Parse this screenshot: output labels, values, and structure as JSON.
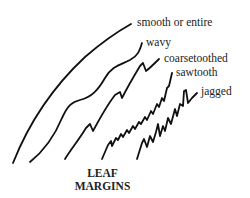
{
  "diagram": {
    "title_line1": "LEAF",
    "title_line2": "MARGINS",
    "margins": [
      {
        "label": "smooth or entire",
        "style": "smooth"
      },
      {
        "label": "wavy",
        "style": "wavy"
      },
      {
        "label": "coarsetoothed",
        "style": "coarse-toothed"
      },
      {
        "label": "sawtooth",
        "style": "sawtooth"
      },
      {
        "label": "jagged",
        "style": "jagged"
      }
    ],
    "colors": {
      "stroke": "#111111",
      "text": "#222222",
      "background": "#ffffff"
    }
  }
}
